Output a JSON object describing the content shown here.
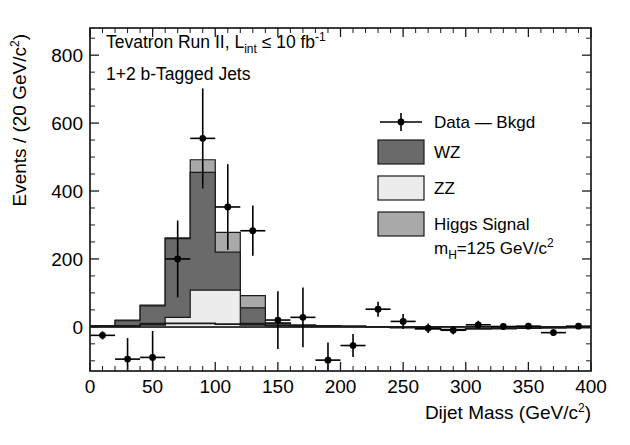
{
  "figure": {
    "title_line1": "Tevatron Run II, L",
    "title_line1_sub": "int",
    "title_line1_rest": " ≤ 10 fb",
    "title_line1_sup": "-1",
    "title_line2": "1+2 b-Tagged Jets"
  },
  "legend": {
    "items": [
      {
        "label": "Data — Bkgd",
        "marker": "point-with-errorbar",
        "color": "#000000"
      },
      {
        "label": "WZ",
        "marker": "swatch",
        "color": "#6a6a6a"
      },
      {
        "label": "ZZ",
        "marker": "swatch",
        "color": "#ececec"
      },
      {
        "label": "Higgs Signal",
        "marker": "swatch",
        "color": "#a9a9a9"
      }
    ],
    "mass_label_pre": "m",
    "mass_label_sub": "H",
    "mass_label_post": "=125 GeV/c",
    "mass_label_sup": "2"
  },
  "chart_data": {
    "type": "bar",
    "xlabel_pre": "Dijet Mass (GeV/c",
    "xlabel_sup": "2",
    "xlabel_post": ")",
    "ylabel_pre": "Events / (20 GeV/c",
    "ylabel_sup": "2",
    "ylabel_post": ")",
    "xlim": [
      0,
      400
    ],
    "ylim": [
      -130,
      880
    ],
    "xticks": [
      0,
      50,
      100,
      150,
      200,
      250,
      300,
      350,
      400
    ],
    "xticklabels": [
      "0",
      "50",
      "100",
      "150",
      "200",
      "250",
      "300",
      "350",
      "400"
    ],
    "yticks": [
      0,
      200,
      400,
      600,
      800
    ],
    "yticklabels": [
      "0",
      "200",
      "400",
      "600",
      "800"
    ],
    "x_minor_step": 10,
    "y_minor_step": 50,
    "grid": false,
    "legend_position": "upper-right",
    "bin_width": 20,
    "bin_edges": [
      0,
      20,
      40,
      60,
      80,
      100,
      120,
      140,
      160,
      180,
      200,
      220,
      240,
      260,
      280,
      300,
      320,
      340,
      360,
      380,
      400
    ],
    "bin_centers": [
      10,
      30,
      50,
      70,
      90,
      110,
      130,
      150,
      170,
      190,
      210,
      230,
      250,
      270,
      290,
      310,
      330,
      350,
      370,
      390
    ],
    "series": [
      {
        "name": "ZZ",
        "color": "#ececec",
        "stack": 1,
        "values": [
          0,
          4,
          10,
          28,
          108,
          108,
          10,
          4,
          2,
          1,
          0,
          0,
          0,
          0,
          0,
          0,
          0,
          0,
          0,
          0
        ]
      },
      {
        "name": "WZ",
        "color": "#6a6a6a",
        "stack": 2,
        "values": [
          4,
          18,
          62,
          260,
          455,
          220,
          56,
          10,
          4,
          2,
          1,
          0,
          0,
          0,
          0,
          0,
          0,
          0,
          0,
          0
        ]
      },
      {
        "name": "Higgs Signal",
        "color": "#a9a9a9",
        "stack": 3,
        "values": [
          4,
          20,
          64,
          262,
          492,
          278,
          92,
          12,
          5,
          2,
          1,
          0,
          0,
          0,
          0,
          0,
          0,
          0,
          0,
          0
        ]
      }
    ],
    "data_points": {
      "name": "Data − Bkgd",
      "color": "#000000",
      "x": [
        10,
        30,
        50,
        70,
        90,
        110,
        130,
        150,
        170,
        190,
        210,
        230,
        250,
        270,
        290,
        310,
        330,
        350,
        370,
        390
      ],
      "y": [
        -25,
        -95,
        -90,
        200,
        555,
        353,
        283,
        20,
        28,
        -98,
        -55,
        52,
        16,
        -4,
        -10,
        6,
        1,
        2,
        -17,
        2
      ],
      "yerr": [
        12,
        62,
        78,
        113,
        147,
        126,
        74,
        85,
        88,
        52,
        34,
        22,
        22,
        14,
        12,
        12,
        8,
        7,
        10,
        6
      ]
    },
    "background_line": {
      "name": "Bkgd",
      "color": "#1a1a1a",
      "x": [
        0,
        20,
        40,
        60,
        80,
        100,
        120,
        140,
        160,
        180,
        200,
        220,
        240,
        260,
        280,
        300,
        320,
        340,
        360,
        380,
        400
      ],
      "y": [
        2,
        2,
        6,
        10,
        10,
        8,
        6,
        4,
        4,
        3,
        2,
        0,
        -2,
        -6,
        -8,
        -6,
        -5,
        -4,
        -3,
        -2,
        -2
      ]
    }
  }
}
